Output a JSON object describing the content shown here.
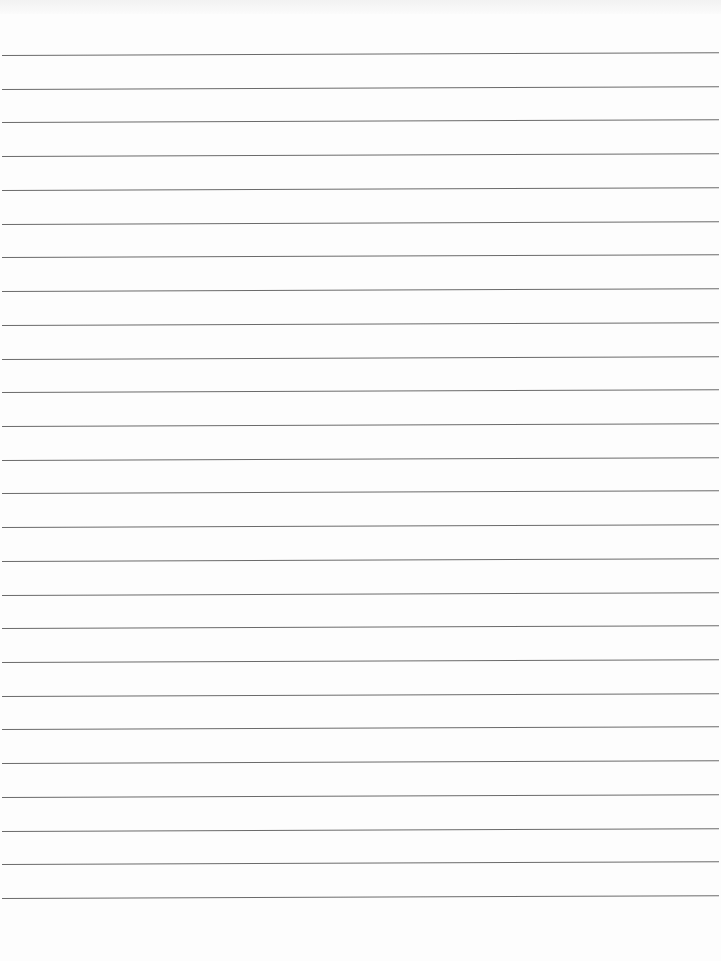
{
  "page": {
    "type": "lined-paper",
    "background_color": "#fdfdfd",
    "rule_color": "#6a6a6a",
    "rule_count": 26,
    "first_rule_y": 55,
    "rule_spacing": 33.72
  }
}
